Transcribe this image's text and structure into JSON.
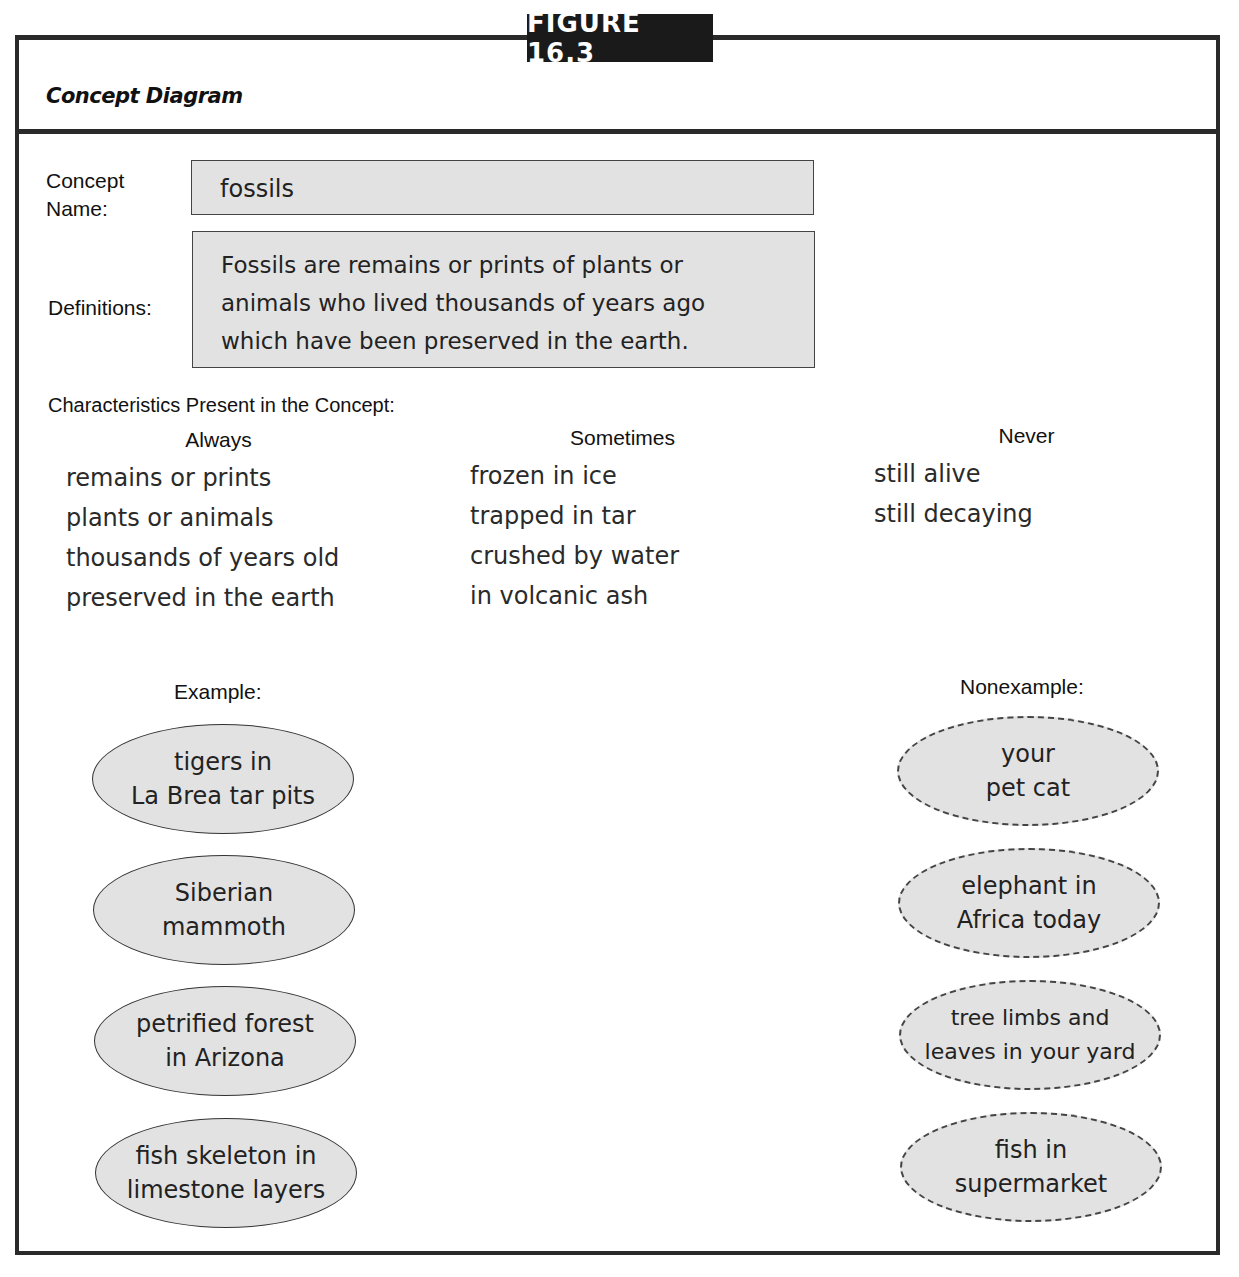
{
  "figure": {
    "tag": "FIGURE 16.3",
    "title": "Concept Diagram"
  },
  "concept": {
    "name_label_line1": "Concept",
    "name_label_line2": "Name:",
    "name_value": "fossils",
    "definition_label": "Definitions:",
    "definition_lines": [
      "Fossils are remains or prints of plants or",
      "animals who lived thousands of years ago",
      "which have been preserved in the earth."
    ]
  },
  "characteristics": {
    "title": "Characteristics Present in the Concept:",
    "columns": [
      {
        "heading": "Always",
        "items": [
          "remains or prints",
          "plants or animals",
          "thousands of years old",
          "preserved in the earth"
        ]
      },
      {
        "heading": "Sometimes",
        "items": [
          "frozen in ice",
          "trapped in tar",
          "crushed by water",
          "in volcanic ash"
        ]
      },
      {
        "heading": "Never",
        "items": [
          "still alive",
          "still decaying"
        ]
      }
    ]
  },
  "examples": {
    "label": "Example:",
    "items": [
      {
        "line1": "tigers in",
        "line2": "La Brea tar pits"
      },
      {
        "line1": "Siberian",
        "line2": "mammoth"
      },
      {
        "line1": "petrified forest",
        "line2": "in Arizona"
      },
      {
        "line1": "fish skeleton in",
        "line2": "limestone layers"
      }
    ]
  },
  "nonexamples": {
    "label": "Nonexample:",
    "items": [
      {
        "line1": "your",
        "line2": "pet cat"
      },
      {
        "line1": "elephant in",
        "line2": "Africa today"
      },
      {
        "line1": "tree limbs and",
        "line2": "leaves in your yard"
      },
      {
        "line1": "fish in",
        "line2": "supermarket"
      }
    ]
  },
  "colors": {
    "frame": "#2a2a2a",
    "box_fill": "#e2e2e2",
    "tag_bg": "#1a1a1a"
  }
}
